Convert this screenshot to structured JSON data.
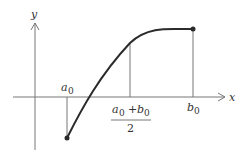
{
  "diagram": {
    "type": "function-graph-bisection",
    "axes": {
      "x_label": "x",
      "y_label": "y"
    },
    "labels": {
      "a0": {
        "base": "a",
        "sub": "0"
      },
      "b0": {
        "base": "b",
        "sub": "0"
      },
      "midpoint": {
        "numerator_a": "a",
        "numerator_a_sub": "0",
        "plus": "+",
        "numerator_b": "b",
        "numerator_b_sub": "0",
        "denominator": "2"
      }
    },
    "curve": {
      "description": "increasing concave curve from (a0, f(a0)<0) to (b0, f(b0)>0)",
      "start_point": "a0 endpoint (below x-axis)",
      "end_point": "b0 endpoint (above x-axis)"
    },
    "colors": {
      "curve": "#2b2b2b",
      "axes": "#666666",
      "guides": "#666666"
    }
  }
}
